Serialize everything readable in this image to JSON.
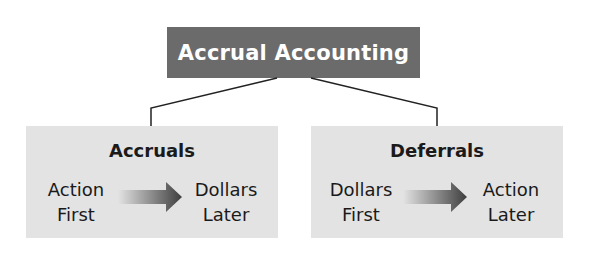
{
  "diagram": {
    "title": "Accrual Accounting",
    "colors": {
      "title_bg": "#6b6b6b",
      "box_bg": "#e3e3e3",
      "text": "#1a1a1a",
      "arrow": "#4a4a4a"
    },
    "branches": [
      {
        "title": "Accruals",
        "from_line1": "Action",
        "from_line2": "First",
        "to_line1": "Dollars",
        "to_line2": "Later"
      },
      {
        "title": "Deferrals",
        "from_line1": "Dollars",
        "from_line2": "First",
        "to_line1": "Action",
        "to_line2": "Later"
      }
    ]
  }
}
